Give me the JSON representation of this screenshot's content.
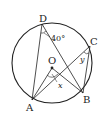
{
  "diagram": {
    "type": "circle-geometry",
    "circle": {
      "center": [
        52,
        63
      ],
      "radius": 40
    },
    "points": {
      "D": {
        "label": "D",
        "xy": [
          42,
          24
        ]
      },
      "C": {
        "label": "C",
        "xy": [
          90,
          46
        ]
      },
      "B": {
        "label": "B",
        "xy": [
          83,
          93
        ]
      },
      "A": {
        "label": "A",
        "xy": [
          32,
          100
        ]
      },
      "O": {
        "label": "O",
        "xy": [
          52,
          68
        ]
      }
    },
    "segments": [
      [
        "D",
        "A"
      ],
      [
        "D",
        "B"
      ],
      [
        "A",
        "C"
      ],
      [
        "C",
        "B"
      ],
      [
        "A",
        "O"
      ],
      [
        "O",
        "B"
      ]
    ],
    "angles": {
      "at_D": {
        "label": "40°"
      },
      "at_O": {
        "label": "x"
      },
      "at_C": {
        "label": "y"
      }
    },
    "colors": {
      "stroke": "#222222",
      "background": "#ffffff"
    }
  }
}
